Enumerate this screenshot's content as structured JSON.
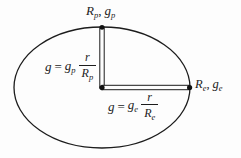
{
  "figure": {
    "pole_label": {
      "radius_base": "R",
      "radius_sub": "p",
      "separator": ",",
      "gravity_base": "g",
      "gravity_sub": "p"
    },
    "equator_label": {
      "radius_base": "R",
      "radius_sub": "e",
      "separator": ",",
      "gravity_base": "g",
      "gravity_sub": "e"
    },
    "polar_formula": {
      "lhs": "g",
      "equals": "=",
      "coeff_base": "g",
      "coeff_sub": "p",
      "numerator": "r",
      "denominator_base": "R",
      "denominator_sub": "p"
    },
    "equatorial_formula": {
      "lhs": "g",
      "equals": "=",
      "coeff_base": "g",
      "coeff_sub": "e",
      "numerator": "r",
      "denominator_base": "R",
      "denominator_sub": "e"
    },
    "colors": {
      "stroke": "#1c1c1c",
      "dot": "#111111",
      "background": "#fdfdfd"
    }
  }
}
